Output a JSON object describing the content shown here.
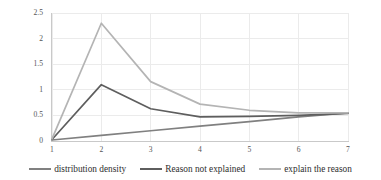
{
  "chart_data": {
    "type": "line",
    "title": "",
    "xlabel": "",
    "ylabel": "",
    "x": [
      1,
      2,
      3,
      4,
      5,
      6,
      7
    ],
    "xticklabels": [
      "1",
      "2",
      "3",
      "4",
      "5",
      "6",
      "7"
    ],
    "yticklabels": [
      "0",
      "0.5",
      "1",
      "1.5",
      "2",
      "2.5"
    ],
    "yticks": [
      0,
      0.5,
      1,
      1.5,
      2,
      2.5
    ],
    "xlim": [
      1,
      7
    ],
    "ylim": [
      0,
      2.5
    ],
    "grid": "horizontal-and-vertical",
    "legend_position": "bottom",
    "series": [
      {
        "name": "distribution density",
        "color": "#808080",
        "values": [
          0.02,
          0.11,
          0.2,
          0.29,
          0.38,
          0.47,
          0.55
        ]
      },
      {
        "name": "Reason not explained",
        "color": "#5e5e5e",
        "values": [
          0.03,
          1.1,
          0.63,
          0.47,
          0.48,
          0.5,
          0.54
        ]
      },
      {
        "name": "explain the reason",
        "color": "#b4b4b4",
        "values": [
          0.04,
          2.3,
          1.16,
          0.72,
          0.6,
          0.55,
          0.55
        ]
      }
    ]
  },
  "legend": {
    "items": [
      {
        "label": "distribution density",
        "color": "#808080"
      },
      {
        "label": "Reason not explained",
        "color": "#5e5e5e"
      },
      {
        "label": "explain the reason",
        "color": "#b4b4b4"
      }
    ]
  },
  "axes": {
    "y_labels": [
      "2.5",
      "2",
      "1.5",
      "1",
      "0.5",
      "0"
    ],
    "x_labels": [
      "1",
      "2",
      "3",
      "4",
      "5",
      "6",
      "7"
    ]
  },
  "colors": {
    "grid": "#e8e8e8",
    "axis": "#c9c9c9",
    "text": "#555555",
    "background": "#ffffff"
  }
}
